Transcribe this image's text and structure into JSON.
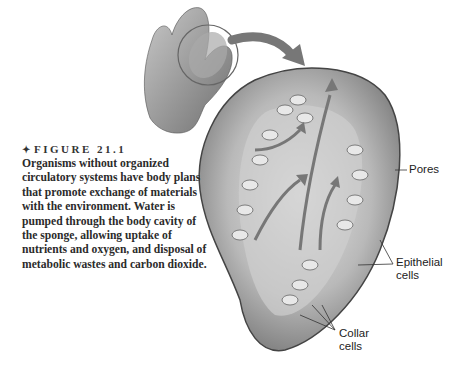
{
  "figure": {
    "marker": "✦",
    "number_label": "FIGURE 21.1",
    "caption": "Organisms without organized circulatory systems have body plans that promote exchange of materials with the environment. Water is pumped through the body cavity of the sponge, allowing uptake of nutrients and oxygen, and disposal of metabolic wastes and carbon dioxide."
  },
  "illustration": {
    "subject": "sponge cross-section",
    "labels": {
      "pores": "Pores",
      "epithelial_line1": "Epithelial",
      "epithelial_line2": "cells",
      "collar_line1": "Collar",
      "collar_line2": "cells"
    }
  }
}
